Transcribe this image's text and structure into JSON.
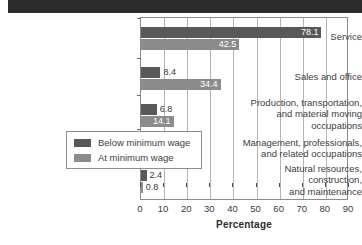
{
  "banner": {
    "text": ""
  },
  "chart_data": {
    "type": "bar",
    "orientation": "horizontal",
    "title": "",
    "xlabel": "Percentage",
    "ylabel": "",
    "xlim": [
      0,
      90
    ],
    "xticks": [
      0,
      10,
      20,
      30,
      40,
      50,
      60,
      70,
      80,
      90
    ],
    "grid": true,
    "grid_axis": "x",
    "legend_position": "inside-lower-left",
    "categories": [
      "Service",
      "Sales and office",
      "Production, transportation,\nand material moving\noccupations",
      "Management, professionals,\nand related occupations",
      "Natural resources,\nconstruction,\nand maintenance"
    ],
    "category_lines": [
      [
        "Service"
      ],
      [
        "Sales and office"
      ],
      [
        "Production, transportation,",
        "and material moving",
        "occupations"
      ],
      [
        "Management, professionals,",
        "and related occupations"
      ],
      [
        "Natural resources,",
        "construction,",
        "and maintenance"
      ]
    ],
    "series": [
      {
        "name": "Below minimum wage",
        "color": "#595959",
        "values": [
          78.1,
          8.4,
          6.8,
          4.5,
          2.4
        ],
        "labels": [
          "78.1",
          "8.4",
          "6.8",
          "4.5",
          "2.4"
        ]
      },
      {
        "name": "At minimum wage",
        "color": "#8c8c8c",
        "values": [
          42.5,
          34.4,
          14.1,
          8.2,
          0.8
        ],
        "labels": [
          "42.5",
          "34.4",
          "14.1",
          "8.2",
          "0.8"
        ]
      }
    ]
  },
  "legend": {
    "items": [
      {
        "label": "Below minimum wage",
        "color": "#595959"
      },
      {
        "label": "At minimum wage",
        "color": "#8c8c8c"
      }
    ]
  },
  "axis": {
    "x_title": "Percentage",
    "tick_labels": [
      "0",
      "10",
      "20",
      "30",
      "40",
      "50",
      "60",
      "70",
      "80",
      "90"
    ]
  }
}
